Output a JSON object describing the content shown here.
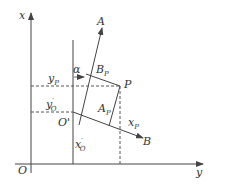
{
  "diagram": {
    "type": "coordinate-transformation",
    "colors": {
      "line": "#444444",
      "text": "#333333",
      "background": "#ffffff"
    },
    "axes": {
      "x_axis_label": "x",
      "y_axis_label": "y",
      "origin_label": "O"
    },
    "local_frame": {
      "origin_label": "O'",
      "axis_a_label": "A",
      "axis_b_label": "B",
      "angle_label": "α"
    },
    "point": {
      "label": "P"
    },
    "projections": {
      "b_p": "B",
      "b_p_sub": "P",
      "a_p": "A",
      "a_p_sub": "P",
      "x_p": "x",
      "x_p_sub": "P",
      "y_p": "y",
      "y_p_sub": "P",
      "y_o": "y",
      "y_o_sup": "′",
      "y_o_sub": "O",
      "x_o": "x",
      "x_o_sup": "′",
      "x_o_sub": "O"
    }
  }
}
